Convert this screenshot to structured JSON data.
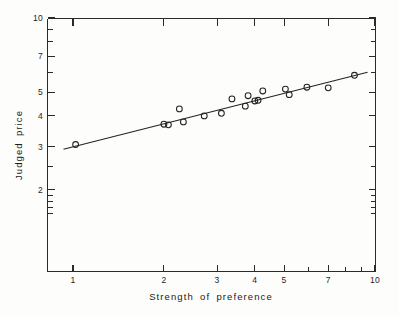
{
  "chart_data": {
    "type": "scatter",
    "title": "",
    "xlabel": "Strength of preference",
    "ylabel": "Judged price",
    "xscale": "log",
    "yscale": "log",
    "xlim": [
      1,
      10
    ],
    "ylim": [
      1.5,
      10
    ],
    "grid": false,
    "legend": null,
    "x_tick_labels": [
      "1",
      "2",
      "3",
      "4",
      "5",
      "7",
      "10"
    ],
    "x_tick_values": [
      1,
      2,
      3,
      4,
      5,
      7,
      10
    ],
    "y_tick_labels": [
      "2",
      "3",
      "4",
      "5",
      "7",
      "10"
    ],
    "y_tick_values": [
      2,
      3,
      4,
      5,
      7,
      10
    ],
    "marker": "open-circle",
    "series": [
      {
        "name": "Judged price",
        "x": [
          1.02,
          2.0,
          2.07,
          2.25,
          2.32,
          2.72,
          3.1,
          3.36,
          3.72,
          3.8,
          4.0,
          4.1,
          4.25,
          5.05,
          5.2,
          5.95,
          7.0,
          8.55
        ],
        "y": [
          3.06,
          3.7,
          3.68,
          4.27,
          3.78,
          4.0,
          4.1,
          4.69,
          4.38,
          4.83,
          4.6,
          4.63,
          5.05,
          5.14,
          4.88,
          5.23,
          5.2,
          5.85
        ]
      }
    ],
    "fit_line": {
      "type": "linear-on-log-log",
      "x_start": 0.93,
      "y_start": 2.93,
      "x_end": 9.45,
      "y_end": 6.02
    }
  },
  "figure": {
    "axis_titles": {
      "x": "Strength of preference",
      "y": "Judged price"
    }
  }
}
